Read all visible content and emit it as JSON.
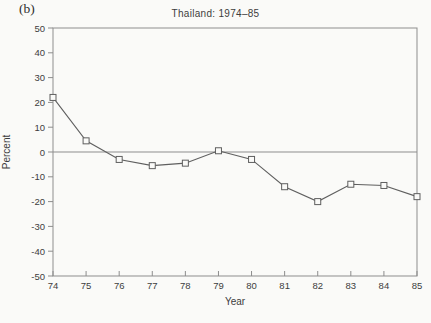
{
  "figure": {
    "panel_label": "(b)"
  },
  "chart_data": {
    "type": "line",
    "title": "Thailand: 1974–85",
    "xlabel": "Year",
    "ylabel": "Percent",
    "x": [
      74,
      75,
      76,
      77,
      78,
      79,
      80,
      81,
      82,
      83,
      84,
      85
    ],
    "x_tick_labels": [
      "74",
      "75",
      "76",
      "77",
      "78",
      "79",
      "80",
      "81",
      "82",
      "83",
      "84",
      "85"
    ],
    "values": [
      22,
      4.5,
      -3,
      -5.5,
      -4.5,
      0.5,
      -3,
      -14,
      -20,
      -13,
      -13.5,
      -18
    ],
    "xlim": [
      74,
      85
    ],
    "ylim": [
      -50,
      50
    ],
    "y_ticks": [
      50,
      40,
      30,
      20,
      10,
      0,
      -10,
      -20,
      -30,
      -40,
      -50
    ],
    "y_tick_labels": [
      "50",
      "40",
      "30",
      "20",
      "10",
      "0",
      "-10",
      "-20",
      "-30",
      "-40",
      "-50"
    ],
    "grid": false,
    "legend": "none",
    "zero_line": true,
    "marker": "open-square",
    "colors": {
      "line": "#5f5f5f",
      "frame": "#8d8d8d",
      "text": "#3d3d3d",
      "background": "#fafaf8"
    }
  }
}
